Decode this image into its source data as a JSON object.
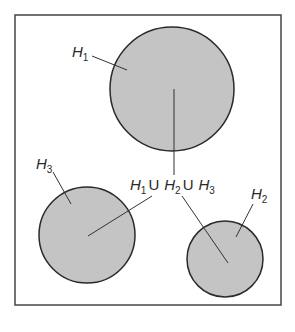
{
  "diagram": {
    "type": "set-union-venn",
    "universe_box": {
      "x": 15,
      "y": 15,
      "w": 266,
      "h": 290,
      "stroke": "#444444"
    },
    "fill_color": "#c4c4c4",
    "stroke_color": "#2a2a2a",
    "sets": [
      {
        "id": "H1",
        "label": "H",
        "subscript": "1",
        "cx": 172,
        "cy": 89,
        "r": 62
      },
      {
        "id": "H2",
        "label": "H",
        "subscript": "2",
        "cx": 225,
        "cy": 259,
        "r": 38
      },
      {
        "id": "H3",
        "label": "H",
        "subscript": "3",
        "cx": 87,
        "cy": 235,
        "r": 48
      }
    ],
    "union_label": {
      "parts": [
        {
          "label": "H",
          "subscript": "1"
        },
        {
          "op": "U"
        },
        {
          "label": "H",
          "subscript": "2"
        },
        {
          "op": "U"
        },
        {
          "label": "H",
          "subscript": "3"
        }
      ]
    }
  }
}
